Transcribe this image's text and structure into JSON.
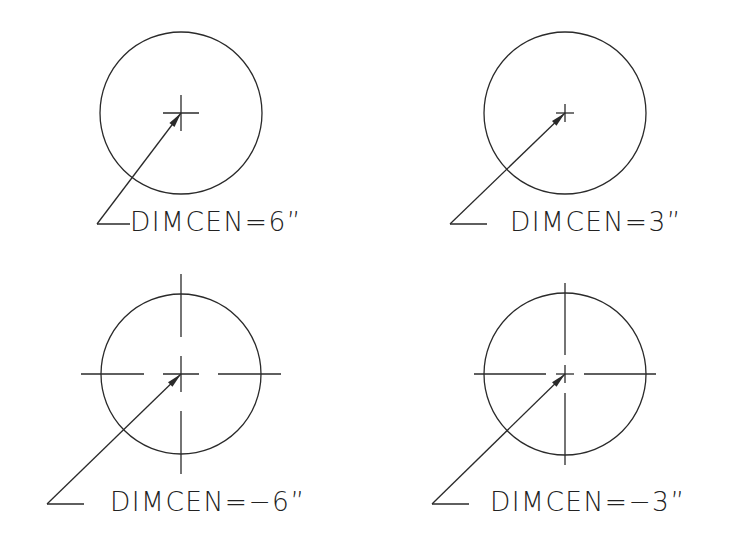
{
  "colors": {
    "stroke": "#2a2a2a",
    "text": "#222222",
    "background": "#ffffff"
  },
  "panels": [
    {
      "id": "top-left",
      "label": "DIMCEN=6”",
      "dimcen": 6,
      "mark_type": "center-mark",
      "center": [
        181,
        113
      ],
      "radius": 81,
      "mark_half": 18,
      "leader": {
        "elbow": [
          97,
          224
        ],
        "tail_end": [
          130,
          224
        ]
      },
      "label_pos": [
        130,
        208
      ]
    },
    {
      "id": "top-right",
      "label": "DIMCEN=3”",
      "dimcen": 3,
      "mark_type": "center-mark",
      "center": [
        565,
        113
      ],
      "radius": 81,
      "mark_half": 9,
      "leader": {
        "elbow": [
          450,
          224
        ],
        "tail_end": [
          487,
          224
        ]
      },
      "label_pos": [
        510,
        208
      ]
    },
    {
      "id": "bottom-left",
      "label": "DIMCEN=−6”",
      "dimcen": -6,
      "mark_type": "center-lines",
      "center": [
        181,
        374
      ],
      "radius": 80,
      "mark_half": 18,
      "gap": 19,
      "overshoot": 20,
      "leader": {
        "elbow": [
          47,
          504
        ],
        "tail_end": [
          84,
          504
        ]
      },
      "label_pos": [
        110,
        488
      ]
    },
    {
      "id": "bottom-right",
      "label": "DIMCEN=−3”",
      "dimcen": -3,
      "mark_type": "center-lines",
      "center": [
        565,
        374
      ],
      "radius": 81,
      "mark_half": 9,
      "gap": 10,
      "overshoot": 10,
      "leader": {
        "elbow": [
          432,
          504
        ],
        "tail_end": [
          469,
          504
        ]
      },
      "label_pos": [
        490,
        488
      ]
    }
  ]
}
